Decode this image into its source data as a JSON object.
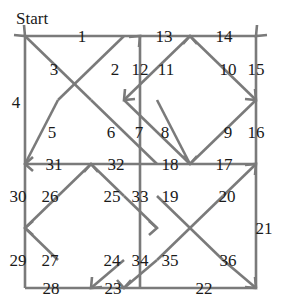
{
  "figure": {
    "start_label": "Start",
    "start_label_pos": {
      "x": 16,
      "y": 24
    },
    "line_color": "#7a7a7a",
    "text_color": "#1a1a1a",
    "background": "#ffffff",
    "width": 285,
    "height": 302
  },
  "chart_data": {
    "type": "diagram",
    "node_count": 36,
    "edge_count": 36
  },
  "grid": {
    "x": [
      25,
      58,
      91,
      124,
      140,
      157,
      190,
      223,
      256
    ],
    "y": [
      36,
      68,
      100,
      132,
      148,
      164,
      196,
      228,
      260,
      288
    ]
  },
  "segments": [
    {
      "id": "s1",
      "label": "1",
      "x1": 25,
      "y1": 36,
      "x2": 140,
      "y2": 36,
      "arrow": "none"
    },
    {
      "id": "s2",
      "label": "13",
      "x1": 140,
      "y1": 36,
      "x2": 190,
      "y2": 36,
      "arrow": "none"
    },
    {
      "id": "s3",
      "label": "14",
      "x1": 190,
      "y1": 36,
      "x2": 256,
      "y2": 36,
      "arrow": "none"
    },
    {
      "id": "s4",
      "label": "4",
      "x1": 25,
      "y1": 36,
      "x2": 25,
      "y2": 164,
      "arrow": "none"
    },
    {
      "id": "s5",
      "label": "30",
      "x1": 25,
      "y1": 164,
      "x2": 25,
      "y2": 288,
      "arrow": "none"
    },
    {
      "id": "s6",
      "label": "15",
      "x1": 256,
      "y1": 36,
      "x2": 256,
      "y2": 164,
      "arrow": "none"
    },
    {
      "id": "s7",
      "label": "21",
      "x1": 256,
      "y1": 164,
      "x2": 256,
      "y2": 288,
      "arrow": "none"
    },
    {
      "id": "s8",
      "label": "28",
      "x1": 25,
      "y1": 288,
      "x2": 124,
      "y2": 288,
      "arrow": "none"
    },
    {
      "id": "s9",
      "label": "22",
      "x1": 124,
      "y1": 288,
      "x2": 256,
      "y2": 288,
      "arrow": "none"
    },
    {
      "id": "s10",
      "label": "31",
      "x1": 91,
      "y1": 164,
      "x2": 25,
      "y2": 164,
      "arrow": "none"
    },
    {
      "id": "s11",
      "label": "32",
      "x1": 91,
      "y1": 164,
      "x2": 157,
      "y2": 164,
      "arrow": "none"
    },
    {
      "id": "s12",
      "label": "18",
      "x1": 157,
      "y1": 164,
      "x2": 190,
      "y2": 164,
      "arrow": "none"
    },
    {
      "id": "s13",
      "label": "17",
      "x1": 190,
      "y1": 164,
      "x2": 256,
      "y2": 164,
      "arrow": "none"
    },
    {
      "id": "s14",
      "label": "12",
      "x1": 140,
      "y1": 36,
      "x2": 140,
      "y2": 164,
      "arrow": "none"
    },
    {
      "id": "s15",
      "label": "33",
      "x1": 140,
      "y1": 164,
      "x2": 140,
      "y2": 228,
      "arrow": "none"
    },
    {
      "id": "s16",
      "label": "34",
      "x1": 140,
      "y1": 228,
      "x2": 140,
      "y2": 288,
      "arrow": "none"
    },
    {
      "id": "s17",
      "label": "3",
      "x1": 25,
      "y1": 36,
      "x2": 91,
      "y2": 100,
      "arrow": "none"
    },
    {
      "id": "s18",
      "label": "2",
      "x1": 124,
      "y1": 36,
      "x2": 58,
      "y2": 100,
      "arrow": "none"
    },
    {
      "id": "s19",
      "label": "5",
      "x1": 58,
      "y1": 100,
      "x2": 25,
      "y2": 164,
      "arrow": "none"
    },
    {
      "id": "s20",
      "label": "6",
      "x1": 91,
      "y1": 100,
      "x2": 157,
      "y2": 164,
      "arrow": "none"
    },
    {
      "id": "s21",
      "label": "11",
      "x1": 190,
      "y1": 36,
      "x2": 124,
      "y2": 100,
      "arrow": "none"
    },
    {
      "id": "s22",
      "label": "10",
      "x1": 190,
      "y1": 36,
      "x2": 256,
      "y2": 100,
      "arrow": "none"
    },
    {
      "id": "s23",
      "label": "7",
      "x1": 124,
      "y1": 100,
      "x2": 190,
      "y2": 164,
      "arrow": "none"
    },
    {
      "id": "s24",
      "label": "8",
      "x1": 157,
      "y1": 100,
      "x2": 190,
      "y2": 164,
      "arrow": "none"
    },
    {
      "id": "s25",
      "label": "9",
      "x1": 256,
      "y1": 100,
      "x2": 190,
      "y2": 164,
      "arrow": "none"
    },
    {
      "id": "s26",
      "label": "26",
      "x1": 58,
      "y1": 196,
      "x2": 91,
      "y2": 164,
      "arrow": "none"
    },
    {
      "id": "s27",
      "label": "25",
      "x1": 124,
      "y1": 196,
      "x2": 91,
      "y2": 164,
      "arrow": "none"
    },
    {
      "id": "s28",
      "label": "27",
      "x1": 58,
      "y1": 196,
      "x2": 25,
      "y2": 228,
      "arrow": "none"
    },
    {
      "id": "s29",
      "label": "29",
      "x1": 58,
      "y1": 260,
      "x2": 25,
      "y2": 228,
      "arrow": "none"
    },
    {
      "id": "s30",
      "label": "24",
      "x1": 124,
      "y1": 196,
      "x2": 157,
      "y2": 228,
      "arrow": "none"
    },
    {
      "id": "s31",
      "label": "23",
      "x1": 124,
      "y1": 260,
      "x2": 91,
      "y2": 288,
      "arrow": "none"
    },
    {
      "id": "s32",
      "label": "19",
      "x1": 157,
      "y1": 196,
      "x2": 223,
      "y2": 260,
      "arrow": "none"
    },
    {
      "id": "s33",
      "label": "20",
      "x1": 223,
      "y1": 196,
      "x2": 157,
      "y2": 260,
      "arrow": "none"
    },
    {
      "id": "s34",
      "label": "16",
      "x1": 223,
      "y1": 196,
      "x2": 256,
      "y2": 164,
      "arrow": "none"
    },
    {
      "id": "s35",
      "label": "36",
      "x1": 223,
      "y1": 260,
      "x2": 256,
      "y2": 288,
      "arrow": "none"
    },
    {
      "id": "s36",
      "label": "35",
      "x1": 157,
      "y1": 260,
      "x2": 124,
      "y2": 288,
      "arrow": "none"
    }
  ],
  "arrowheads": [
    {
      "id": "a1",
      "x": 25,
      "y": 36,
      "dir": "down-right"
    },
    {
      "id": "a2",
      "x": 140,
      "y": 36,
      "dir": "up-right"
    },
    {
      "id": "a3",
      "x": 190,
      "y": 36,
      "dir": "up"
    },
    {
      "id": "a4",
      "x": 256,
      "y": 36,
      "dir": "down-left"
    },
    {
      "id": "a5",
      "x": 124,
      "y": 100,
      "dir": "down-left"
    },
    {
      "id": "a6",
      "x": 256,
      "y": 100,
      "dir": "down-right"
    },
    {
      "id": "a7",
      "x": 25,
      "y": 164,
      "dir": "left"
    },
    {
      "id": "a8",
      "x": 91,
      "y": 164,
      "dir": "up"
    },
    {
      "id": "a9",
      "x": 190,
      "y": 164,
      "dir": "down"
    },
    {
      "id": "a10",
      "x": 256,
      "y": 164,
      "dir": "up-right"
    },
    {
      "id": "a11",
      "x": 25,
      "y": 228,
      "dir": "left"
    },
    {
      "id": "a12",
      "x": 157,
      "y": 228,
      "dir": "right"
    },
    {
      "id": "a13",
      "x": 124,
      "y": 288,
      "dir": "down"
    },
    {
      "id": "a14",
      "x": 91,
      "y": 288,
      "dir": "down-left"
    },
    {
      "id": "a15",
      "x": 256,
      "y": 288,
      "dir": "down-right"
    }
  ],
  "labels": [
    {
      "id": "l1",
      "text": "1",
      "x": 82,
      "y": 42
    },
    {
      "id": "l2",
      "text": "13",
      "x": 164,
      "y": 42
    },
    {
      "id": "l3",
      "text": "14",
      "x": 224,
      "y": 42
    },
    {
      "id": "l4",
      "text": "3",
      "x": 54,
      "y": 75
    },
    {
      "id": "l5",
      "text": "2",
      "x": 115,
      "y": 75
    },
    {
      "id": "l6",
      "text": "12",
      "x": 140,
      "y": 75
    },
    {
      "id": "l7",
      "text": "11",
      "x": 166,
      "y": 75
    },
    {
      "id": "l8",
      "text": "10",
      "x": 228,
      "y": 75
    },
    {
      "id": "l9",
      "text": "15",
      "x": 256,
      "y": 75
    },
    {
      "id": "l10",
      "text": "4",
      "x": 16,
      "y": 108
    },
    {
      "id": "l11",
      "text": "5",
      "x": 52,
      "y": 138
    },
    {
      "id": "l12",
      "text": "6",
      "x": 111,
      "y": 138
    },
    {
      "id": "l13",
      "text": "7",
      "x": 139,
      "y": 138
    },
    {
      "id": "l14",
      "text": "8",
      "x": 165,
      "y": 138
    },
    {
      "id": "l15",
      "text": "9",
      "x": 228,
      "y": 138
    },
    {
      "id": "l16",
      "text": "16",
      "x": 256,
      "y": 138
    },
    {
      "id": "l17",
      "text": "31",
      "x": 54,
      "y": 170
    },
    {
      "id": "l18",
      "text": "32",
      "x": 116,
      "y": 170
    },
    {
      "id": "l19",
      "text": "18",
      "x": 170,
      "y": 170
    },
    {
      "id": "l20",
      "text": "17",
      "x": 224,
      "y": 170
    },
    {
      "id": "l21",
      "text": "30",
      "x": 18,
      "y": 202
    },
    {
      "id": "l22",
      "text": "26",
      "x": 50,
      "y": 202
    },
    {
      "id": "l23",
      "text": "25",
      "x": 112,
      "y": 202
    },
    {
      "id": "l24",
      "text": "33",
      "x": 140,
      "y": 202
    },
    {
      "id": "l25",
      "text": "19",
      "x": 170,
      "y": 202
    },
    {
      "id": "l26",
      "text": "20",
      "x": 227,
      "y": 202
    },
    {
      "id": "l27",
      "text": "21",
      "x": 264,
      "y": 234
    },
    {
      "id": "l28",
      "text": "29",
      "x": 18,
      "y": 266
    },
    {
      "id": "l29",
      "text": "27",
      "x": 50,
      "y": 266
    },
    {
      "id": "l30",
      "text": "24",
      "x": 112,
      "y": 266
    },
    {
      "id": "l31",
      "text": "34",
      "x": 140,
      "y": 266
    },
    {
      "id": "l32",
      "text": "35",
      "x": 170,
      "y": 266
    },
    {
      "id": "l33",
      "text": "36",
      "x": 228,
      "y": 266
    },
    {
      "id": "l34",
      "text": "28",
      "x": 51,
      "y": 294
    },
    {
      "id": "l35",
      "text": "23",
      "x": 113,
      "y": 294
    },
    {
      "id": "l36",
      "text": "22",
      "x": 204,
      "y": 294
    }
  ]
}
